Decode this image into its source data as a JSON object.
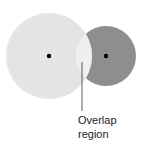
{
  "diagram": {
    "type": "venn-overlap",
    "circles": [
      {
        "name": "large-circle",
        "cx": 49,
        "cy": 56,
        "r": 43,
        "color": "#e4e4e4"
      },
      {
        "name": "small-circle",
        "cx": 106,
        "cy": 56,
        "r": 30,
        "color": "#8e8e8e"
      }
    ],
    "overlap_color": "#ececec",
    "center_dot_color": "#000000",
    "label": {
      "line1": "Overlap",
      "line2": "region"
    }
  }
}
